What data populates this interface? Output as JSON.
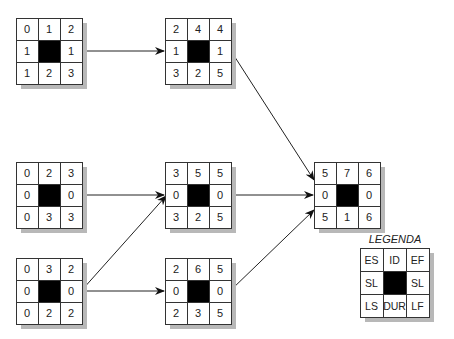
{
  "diagram": {
    "type": "network activity-on-node diagram",
    "nodes": [
      {
        "id": "n1",
        "es": "0",
        "ef": "2",
        "sl_left": "1",
        "sl_right": "1",
        "ls": "1",
        "dur": "2",
        "lf": "3"
      },
      {
        "id": "n2",
        "es": "0",
        "ef": "3",
        "sl_left": "0",
        "sl_right": "0",
        "ls": "0",
        "dur": "3",
        "lf": "3"
      },
      {
        "id": "n3",
        "es": "0",
        "ef": "2",
        "sl_left": "0",
        "sl_right": "0",
        "ls": "0",
        "dur": "2",
        "lf": "2"
      },
      {
        "id": "n4",
        "es": "2",
        "ef": "4",
        "sl_left": "1",
        "sl_right": "1",
        "ls": "3",
        "dur": "2",
        "lf": "5"
      },
      {
        "id": "n5",
        "es": "3",
        "ef": "5",
        "sl_left": "0",
        "sl_right": "0",
        "ls": "3",
        "dur": "2",
        "lf": "5"
      },
      {
        "id": "n6",
        "es": "2",
        "ef": "5",
        "sl_left": "0",
        "sl_right": "0",
        "ls": "2",
        "dur": "3",
        "lf": "5"
      },
      {
        "id": "n7",
        "es": "5",
        "ef": "6",
        "sl_left": "0",
        "sl_right": "0",
        "ls": "5",
        "dur": "1",
        "lf": "6"
      }
    ],
    "top_center_values": {
      "n1": "1",
      "n2": "2",
      "n3": "3",
      "n4": "4",
      "n5": "5",
      "n6": "6",
      "n7": "7"
    },
    "edges": [
      [
        "n1",
        "n4"
      ],
      [
        "n2",
        "n5"
      ],
      [
        "n3",
        "n5"
      ],
      [
        "n3",
        "n6"
      ],
      [
        "n4",
        "n7"
      ],
      [
        "n5",
        "n7"
      ],
      [
        "n6",
        "n7"
      ]
    ],
    "legend": {
      "title": "LEGENDA",
      "es": "ES",
      "id": "ID",
      "ef": "EF",
      "sl_left": "SL",
      "sl_right": "SL",
      "ls": "LS",
      "dur": "DUR",
      "lf": "LF"
    }
  }
}
